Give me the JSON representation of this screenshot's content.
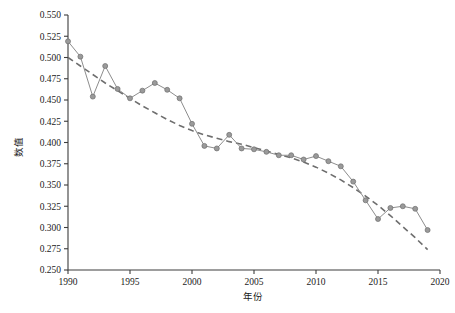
{
  "chart_data": {
    "type": "line",
    "title": "",
    "xlabel": "年份",
    "ylabel": "数值",
    "xlim": [
      1990,
      2020
    ],
    "ylim": [
      0.25,
      0.55
    ],
    "grid": false,
    "legend_position": "none",
    "x_ticks": [
      1990,
      1995,
      2000,
      2005,
      2010,
      2015,
      2020
    ],
    "y_ticks": [
      0.25,
      0.275,
      0.3,
      0.325,
      0.35,
      0.375,
      0.4,
      0.425,
      0.45,
      0.475,
      0.5,
      0.525,
      0.55
    ],
    "x_tick_labels": [
      "1990",
      "1995",
      "2000",
      "2005",
      "2010",
      "2015",
      "2020"
    ],
    "y_tick_labels": [
      "0.250",
      "0.275",
      "0.300",
      "0.325",
      "0.350",
      "0.375",
      "0.400",
      "0.425",
      "0.450",
      "0.475",
      "0.500",
      "0.525",
      "0.550"
    ],
    "x": [
      1990,
      1991,
      1992,
      1993,
      1994,
      1995,
      1996,
      1997,
      1998,
      1999,
      2000,
      2001,
      2002,
      2003,
      2004,
      2005,
      2006,
      2007,
      2008,
      2009,
      2010,
      2011,
      2012,
      2013,
      2014,
      2015,
      2016,
      2017,
      2018,
      2019
    ],
    "series": [
      {
        "name": "观测值",
        "style": "solid-with-markers",
        "color": "#8d8d8d",
        "marker": "circle",
        "values": [
          0.519,
          0.501,
          0.454,
          0.49,
          0.463,
          0.452,
          0.461,
          0.47,
          0.462,
          0.452,
          0.422,
          0.396,
          0.393,
          0.409,
          0.393,
          0.392,
          0.389,
          0.385,
          0.385,
          0.38,
          0.384,
          0.378,
          0.372,
          0.354,
          0.332,
          0.31,
          0.323,
          0.325,
          0.322,
          0.297
        ]
      },
      {
        "name": "趋势线",
        "style": "dashed",
        "color": "#6e6e6e",
        "values": [
          0.5,
          0.49,
          0.48,
          0.47,
          0.461,
          0.452,
          0.443,
          0.435,
          0.427,
          0.42,
          0.414,
          0.409,
          0.405,
          0.401,
          0.398,
          0.394,
          0.39,
          0.386,
          0.382,
          0.377,
          0.371,
          0.364,
          0.356,
          0.347,
          0.337,
          0.326,
          0.314,
          0.301,
          0.288,
          0.274
        ]
      }
    ]
  }
}
